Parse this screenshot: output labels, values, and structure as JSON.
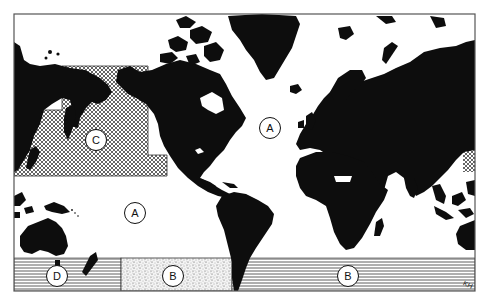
{
  "map": {
    "type": "world-map-mercator",
    "style": "black land on white ocean, monochrome",
    "colors": {
      "land": "#0d0d0d",
      "ocean": "#ffffff",
      "frame": "#555555"
    },
    "zones": [
      {
        "id": "A-pacific",
        "letter": "A",
        "fill": "none",
        "description": "Open ocean (Pacific)"
      },
      {
        "id": "A-atlantic",
        "letter": "A",
        "fill": "none",
        "description": "Open ocean (North Atlantic)"
      },
      {
        "id": "B-stipple",
        "letter": "B",
        "fill": "stipple",
        "description": "Southern ocean, South Pacific stippled band"
      },
      {
        "id": "B-stripes",
        "letter": "B",
        "fill": "horizontal-lines",
        "description": "Southern ocean band, Atlantic/Indian sector"
      },
      {
        "id": "C",
        "letter": "C",
        "fill": "crosshatch",
        "description": "North Pacific crosshatched area"
      },
      {
        "id": "D",
        "letter": "D",
        "fill": "horizontal-lines",
        "description": "Southern ocean band south of Australia"
      }
    ]
  },
  "labels": [
    {
      "letter": "C",
      "x": 96,
      "y": 140
    },
    {
      "letter": "A",
      "x": 270,
      "y": 128
    },
    {
      "letter": "A",
      "x": 135,
      "y": 213
    },
    {
      "letter": "D",
      "x": 57,
      "y": 276
    },
    {
      "letter": "B",
      "x": 173,
      "y": 276
    },
    {
      "letter": "B",
      "x": 348,
      "y": 276
    }
  ],
  "signature": "KH"
}
